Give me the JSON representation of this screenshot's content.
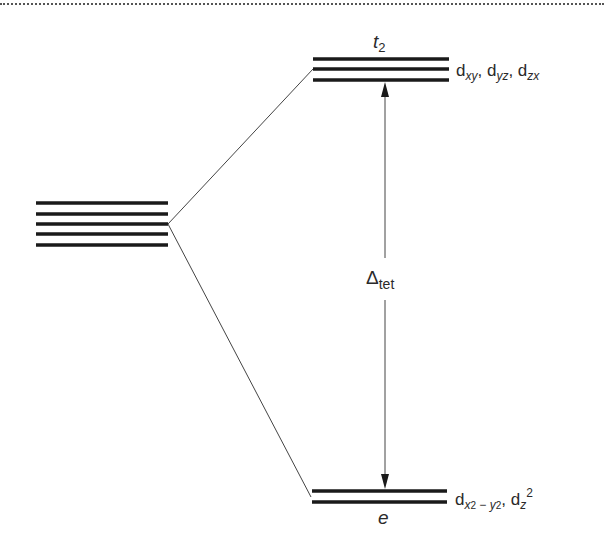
{
  "diagram": {
    "degenerate_set": {
      "orbital_count": 5
    },
    "upper_set": {
      "symmetry_label": "t",
      "symmetry_subscript": "2",
      "orbital_count": 3,
      "orbital_prefix": "d",
      "orbitals": [
        "xy",
        "yz",
        "zx"
      ]
    },
    "lower_set": {
      "symmetry_label": "e",
      "orbital_count": 2,
      "orbital_prefix": "d",
      "orbital_1_sub_a": "x",
      "orbital_1_sub_a_sup": "2",
      "orbital_1_sub_sep": " − ",
      "orbital_1_sub_b": "y",
      "orbital_1_sub_b_sup": "2",
      "orbital_2_sub": "z",
      "orbital_2_sup": "2"
    },
    "splitting": {
      "symbol": "Δ",
      "subscript": "tet"
    },
    "separator": ", ",
    "colors": {
      "line": "#1a1a1a",
      "connector": "#444444",
      "text": "#2a2a2a"
    }
  }
}
